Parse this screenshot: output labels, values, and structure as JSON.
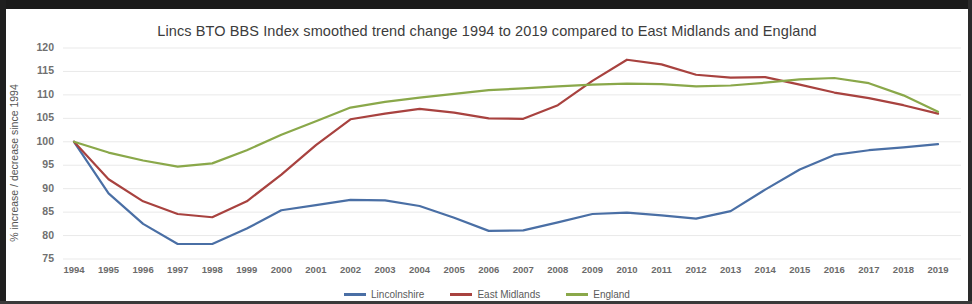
{
  "chart_data": {
    "type": "line",
    "title": "Lincs BTO BBS Index smoothed trend change 1994 to 2019 compared to East Midlands and England",
    "xlabel": "",
    "ylabel": "% increase / decrease since 1994",
    "ylim": [
      75,
      120
    ],
    "ytick_step": 5,
    "yticks": [
      120,
      115,
      110,
      105,
      100,
      95,
      90,
      85,
      80,
      75
    ],
    "grid": true,
    "legend_position": "bottom",
    "x": [
      1994,
      1995,
      1996,
      1997,
      1998,
      1999,
      2000,
      2001,
      2002,
      2003,
      2004,
      2005,
      2006,
      2007,
      2008,
      2009,
      2010,
      2011,
      2012,
      2013,
      2014,
      2015,
      2016,
      2017,
      2018,
      2019
    ],
    "categories": [
      "1994",
      "1995",
      "1996",
      "1997",
      "1998",
      "1999",
      "2000",
      "2001",
      "2002",
      "2003",
      "2004",
      "2005",
      "2006",
      "2007",
      "2008",
      "2009",
      "2010",
      "2011",
      "2012",
      "2013",
      "2014",
      "2015",
      "2016",
      "2017",
      "2018",
      "2019"
    ],
    "series": [
      {
        "name": "Lincolnshire",
        "color": "#4a6fa5",
        "values": [
          100.0,
          89.0,
          82.5,
          78.2,
          78.2,
          81.5,
          85.4,
          86.5,
          87.6,
          87.5,
          86.3,
          83.8,
          81.0,
          81.1,
          82.8,
          84.6,
          84.9,
          84.3,
          83.6,
          85.2,
          89.8,
          94.1,
          97.2,
          98.2,
          98.8,
          99.5
        ]
      },
      {
        "name": "East Midlands",
        "color": "#a8423f",
        "values": [
          100.0,
          92.0,
          87.3,
          84.6,
          83.9,
          87.3,
          93.0,
          99.3,
          104.8,
          106.0,
          107.0,
          106.2,
          105.0,
          104.9,
          107.8,
          113.0,
          117.5,
          116.5,
          114.3,
          113.7,
          113.8,
          112.2,
          110.5,
          109.3,
          107.8,
          106.0
        ]
      },
      {
        "name": "England",
        "color": "#8aa84a",
        "values": [
          100.0,
          97.7,
          96.0,
          94.7,
          95.4,
          98.2,
          101.5,
          104.4,
          107.3,
          108.5,
          109.4,
          110.2,
          111.0,
          111.4,
          111.8,
          112.2,
          112.4,
          112.3,
          111.8,
          112.0,
          112.6,
          113.3,
          113.6,
          112.5,
          109.9,
          106.4
        ]
      }
    ]
  },
  "legend": {
    "items": [
      {
        "label": "Lincolnshire",
        "color": "#4a6fa5"
      },
      {
        "label": "East Midlands",
        "color": "#a8423f"
      },
      {
        "label": "England",
        "color": "#8aa84a"
      }
    ]
  },
  "axes": {
    "plot_left_px": 57,
    "plot_right_px": 955,
    "plot_top_px": 39,
    "plot_bottom_px": 250,
    "x_first_px": 68,
    "x_last_px": 932,
    "y_top_value": 120,
    "y_bottom_value": 75
  }
}
